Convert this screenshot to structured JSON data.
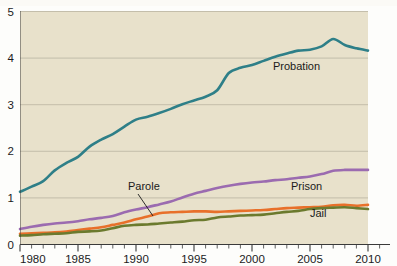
{
  "chart_data": {
    "type": "line",
    "title": "",
    "xlabel": "",
    "ylabel": "",
    "xlim": [
      1980,
      2010
    ],
    "ylim": [
      0,
      5
    ],
    "grid": true,
    "gridlines_y": [
      1,
      2,
      3,
      4,
      5
    ],
    "y_ticks": [
      "0",
      "1",
      "2",
      "3",
      "4",
      "5"
    ],
    "y_tick_values": [
      0,
      1,
      2,
      3,
      4,
      5
    ],
    "x_ticks": [
      "1980",
      "1985",
      "1990",
      "1995",
      "2000",
      "2005",
      "2010"
    ],
    "x_tick_values": [
      1980,
      1985,
      1990,
      1995,
      2000,
      2005,
      2010
    ],
    "x_minor_step": 1,
    "legend_position": "inline-annotations",
    "x": [
      1980,
      1981,
      1982,
      1983,
      1984,
      1985,
      1986,
      1987,
      1988,
      1989,
      1990,
      1991,
      1992,
      1993,
      1994,
      1995,
      1996,
      1997,
      1998,
      1999,
      2000,
      2001,
      2002,
      2003,
      2004,
      2005,
      2006,
      2007,
      2008,
      2009,
      2010
    ],
    "series": [
      {
        "name": "Probation",
        "color": "#2E7F88",
        "label": "Probation",
        "values": [
          1.12,
          1.23,
          1.35,
          1.58,
          1.74,
          1.87,
          2.09,
          2.24,
          2.36,
          2.52,
          2.67,
          2.73,
          2.81,
          2.9,
          3.0,
          3.08,
          3.16,
          3.3,
          3.67,
          3.78,
          3.84,
          3.93,
          4.02,
          4.09,
          4.15,
          4.17,
          4.24,
          4.4,
          4.27,
          4.2,
          4.15
        ]
      },
      {
        "name": "Prison",
        "color": "#9B6BB0",
        "label": "Prison",
        "values": [
          0.32,
          0.37,
          0.41,
          0.44,
          0.46,
          0.49,
          0.53,
          0.56,
          0.6,
          0.68,
          0.74,
          0.79,
          0.85,
          0.91,
          1.0,
          1.08,
          1.14,
          1.2,
          1.25,
          1.29,
          1.32,
          1.34,
          1.37,
          1.39,
          1.42,
          1.45,
          1.5,
          1.57,
          1.59,
          1.59,
          1.59
        ]
      },
      {
        "name": "Parole",
        "color": "#E8702A",
        "label": "Parole",
        "values": [
          0.22,
          0.23,
          0.24,
          0.25,
          0.27,
          0.3,
          0.33,
          0.36,
          0.41,
          0.46,
          0.53,
          0.59,
          0.66,
          0.68,
          0.69,
          0.7,
          0.7,
          0.69,
          0.7,
          0.71,
          0.72,
          0.73,
          0.75,
          0.77,
          0.78,
          0.79,
          0.8,
          0.83,
          0.84,
          0.82,
          0.84
        ]
      },
      {
        "name": "Jail",
        "color": "#6B7A2E",
        "label": "Jail",
        "values": [
          0.18,
          0.19,
          0.21,
          0.22,
          0.23,
          0.26,
          0.27,
          0.29,
          0.34,
          0.39,
          0.41,
          0.42,
          0.44,
          0.46,
          0.48,
          0.51,
          0.52,
          0.57,
          0.59,
          0.61,
          0.62,
          0.63,
          0.66,
          0.69,
          0.71,
          0.75,
          0.77,
          0.78,
          0.79,
          0.77,
          0.75
        ]
      }
    ],
    "annotations": [
      {
        "text": "Probation",
        "series": "Probation",
        "x_px": 273,
        "y_px": 70
      },
      {
        "text": "Parole",
        "series": "Parole",
        "x_px": 128,
        "y_px": 190,
        "leader": true
      },
      {
        "text": "Prison",
        "series": "Prison",
        "x_px": 291,
        "y_px": 190
      },
      {
        "text": "Jail",
        "series": "Jail",
        "x_px": 310,
        "y_px": 217
      }
    ],
    "colors": {
      "plot_background": "#E8E1CB",
      "page_background": "#fdfdfb",
      "gridline": "#b3ae9c",
      "axis": "#3a3a3a",
      "text": "#1a1a1a"
    }
  }
}
